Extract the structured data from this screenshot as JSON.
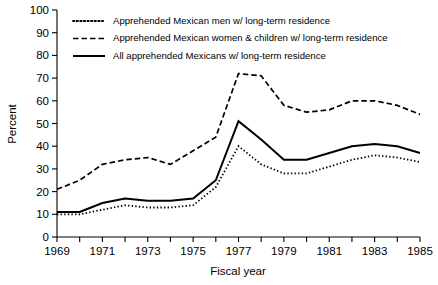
{
  "chart_data": {
    "type": "line",
    "title": "",
    "xlabel": "Fiscal year",
    "ylabel": "Percent",
    "xlim": [
      1969,
      1985
    ],
    "ylim": [
      0,
      100
    ],
    "grid": false,
    "legend_position": "top-left-inside",
    "y_ticks": [
      0,
      10,
      20,
      30,
      40,
      50,
      60,
      70,
      80,
      90,
      100
    ],
    "y_tick_labels": [
      "0",
      "10",
      "20",
      "30",
      "40",
      "50",
      "60",
      "70",
      "80",
      "90",
      "100"
    ],
    "x": [
      1969,
      1970,
      1971,
      1972,
      1973,
      1974,
      1975,
      1976,
      1977,
      1978,
      1979,
      1980,
      1981,
      1982,
      1983,
      1984,
      1985
    ],
    "x_major_ticks": [
      1969,
      1971,
      1973,
      1975,
      1977,
      1979,
      1981,
      1983,
      1985
    ],
    "x_major_tick_labels": [
      "1969",
      "1971",
      "1973",
      "1975",
      "1977",
      "1979",
      "1981",
      "1983",
      "1985"
    ],
    "x_minor_ticks": [
      1970,
      1972,
      1974,
      1976,
      1978,
      1980,
      1982,
      1984
    ],
    "series": [
      {
        "name": "Apprehended Mexican men w/ long-term residence",
        "style": "dotted",
        "color": "#000000",
        "values": [
          10,
          10,
          12,
          14,
          13,
          13,
          14,
          22,
          40,
          32,
          28,
          28,
          31,
          34,
          36,
          35,
          33
        ]
      },
      {
        "name": "Apprehended Mexican women & children w/ long-term residence",
        "style": "dashed",
        "color": "#000000",
        "values": [
          21,
          25,
          32,
          34,
          35,
          32,
          38,
          44,
          72,
          71,
          58,
          55,
          56,
          60,
          60,
          58,
          54
        ]
      },
      {
        "name": "All apprehended Mexicans w/ long-term residence",
        "style": "solid",
        "color": "#000000",
        "values": [
          11,
          11,
          15,
          17,
          16,
          16,
          17,
          25,
          51,
          43,
          34,
          34,
          37,
          40,
          41,
          40,
          37
        ]
      }
    ]
  },
  "legend": {
    "items": [
      {
        "label": "Apprehended Mexican men w/ long-term residence",
        "style": "dotted"
      },
      {
        "label": "Apprehended Mexican women & children w/ long-term residence",
        "style": "dashed"
      },
      {
        "label": "All apprehended Mexicans w/ long-term residence",
        "style": "solid"
      }
    ]
  }
}
